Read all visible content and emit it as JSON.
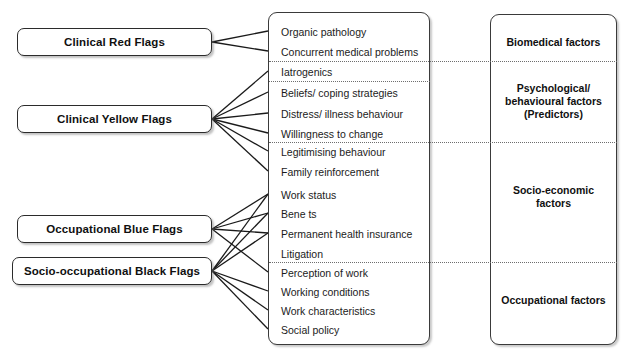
{
  "diagram": {
    "colors": {
      "box_border": "#2b2b2b",
      "line": "#1a1a1a",
      "separator": "#6e6e6e",
      "background": "#ffffff",
      "text": "#101010"
    }
  },
  "flags": [
    {
      "id": "red",
      "label": "Clinical Red Flags",
      "x": 17,
      "y": 28,
      "w": 195,
      "h": 28
    },
    {
      "id": "yellow",
      "label": "Clinical Yellow Flags",
      "x": 17,
      "y": 105,
      "w": 195,
      "h": 28
    },
    {
      "id": "blue",
      "label": "Occupational Blue Flags",
      "x": 17,
      "y": 215,
      "w": 195,
      "h": 28
    },
    {
      "id": "black",
      "label": "Socio-occupational Black Flags",
      "x": 12,
      "y": 257,
      "w": 200,
      "h": 28
    }
  ],
  "items": [
    {
      "id": "organic-pathology",
      "label": "Organic pathology",
      "y": 31
    },
    {
      "id": "concurrent-medical-problems",
      "label": "Concurrent medical problems",
      "y": 51
    },
    {
      "id": "iatrogenics",
      "label": "Iatrogenics",
      "y": 71
    },
    {
      "id": "beliefs-coping-strategies",
      "label": "Beliefs/ coping strategies",
      "y": 92
    },
    {
      "id": "distress-illness-behaviour",
      "label": "Distress/ illness behaviour",
      "y": 113
    },
    {
      "id": "willingness-to-change",
      "label": "Willingness to change",
      "y": 133
    },
    {
      "id": "legitimising-behaviour",
      "label": "Legitimising behaviour",
      "y": 151
    },
    {
      "id": "family-reinforcement",
      "label": "Family reinforcement",
      "y": 171
    },
    {
      "id": "work-status",
      "label": "Work status",
      "y": 194
    },
    {
      "id": "benefits",
      "label": "Bene ts",
      "y": 213
    },
    {
      "id": "permanent-health-insurance",
      "label": "Permanent health insurance",
      "y": 233
    },
    {
      "id": "litigation",
      "label": "Litigation",
      "y": 253
    },
    {
      "id": "perception-of-work",
      "label": "Perception of work",
      "y": 272
    },
    {
      "id": "working-conditions",
      "label": "Working conditions",
      "y": 291
    },
    {
      "id": "work-characteristics",
      "label": "Work characteristics",
      "y": 310
    },
    {
      "id": "social-policy",
      "label": "Social policy",
      "y": 329
    }
  ],
  "groups": [
    {
      "id": "biomedical",
      "label": "Biomedical factors",
      "y": 41
    },
    {
      "id": "psychological",
      "label": "Psychological/ behavioural factors (Predictors)",
      "y": 100
    },
    {
      "id": "socioeconomic",
      "label": "Socio-economic factors",
      "y": 196
    },
    {
      "id": "occupational",
      "label": "Occupational factors",
      "y": 299
    }
  ],
  "group_lines": [
    {
      "id": "psychological",
      "line1": "Psychological/",
      "line2": "behavioural factors",
      "line3": "(Predictors)"
    },
    {
      "id": "socioeconomic",
      "line1": "Socio-economic",
      "line2": "factors",
      "line3": ""
    },
    {
      "id": "biomedical",
      "line1": "Biomedical factors",
      "line2": "",
      "line3": ""
    },
    {
      "id": "occupational",
      "line1": "Occupational factors",
      "line2": "",
      "line3": ""
    }
  ],
  "separators": [
    {
      "id": "sep-biomedical-psychological",
      "y": 61,
      "x": 269,
      "w": 348
    },
    {
      "id": "sep-iatrogenics-beliefs",
      "y": 81,
      "x": 269,
      "w": 161
    },
    {
      "id": "sep-psychological-socio",
      "y": 142,
      "x": 269,
      "w": 348
    },
    {
      "id": "sep-socio-occupational",
      "y": 262,
      "x": 269,
      "w": 348
    }
  ],
  "connections": [
    {
      "from": "red",
      "to": "organic-pathology"
    },
    {
      "from": "red",
      "to": "concurrent-medical-problems"
    },
    {
      "from": "yellow",
      "to": "iatrogenics"
    },
    {
      "from": "yellow",
      "to": "beliefs-coping-strategies"
    },
    {
      "from": "yellow",
      "to": "distress-illness-behaviour"
    },
    {
      "from": "yellow",
      "to": "willingness-to-change"
    },
    {
      "from": "yellow",
      "to": "legitimising-behaviour"
    },
    {
      "from": "yellow",
      "to": "family-reinforcement"
    },
    {
      "from": "blue",
      "to": "work-status"
    },
    {
      "from": "blue",
      "to": "benefits"
    },
    {
      "from": "blue",
      "to": "permanent-health-insurance"
    },
    {
      "from": "blue",
      "to": "perception-of-work"
    },
    {
      "from": "black",
      "to": "work-status"
    },
    {
      "from": "black",
      "to": "benefits"
    },
    {
      "from": "black",
      "to": "permanent-health-insurance"
    },
    {
      "from": "black",
      "to": "working-conditions"
    },
    {
      "from": "black",
      "to": "work-characteristics"
    },
    {
      "from": "black",
      "to": "social-policy"
    }
  ]
}
